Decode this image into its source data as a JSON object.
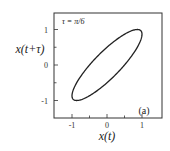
{
  "chart_data": {
    "type": "line",
    "title": "",
    "annotation": "τ = π/6",
    "panel_label": "(a)",
    "xlabel": "x(t)",
    "ylabel": "x(t+τ)",
    "xlim": [
      -1.35,
      1.35
    ],
    "ylim": [
      -1.45,
      1.45
    ],
    "xticks": [
      -1,
      0,
      1
    ],
    "yticks": [
      -1,
      0,
      1
    ],
    "xtick_labels": [
      "-1",
      "0",
      "1"
    ],
    "ytick_labels": [
      "-1",
      "0",
      "1"
    ],
    "minor_ticks_step": 0.5,
    "grid": false,
    "series": [
      {
        "name": "phase portrait x(t) = sin(t), x(t+τ) = sin(t+π/6)",
        "shape": "ellipse",
        "description": "Closed elliptical curve along the diagonal; x in [-1,1], y in [-1,1]",
        "x": [
          0.0,
          0.5,
          0.866,
          1.0,
          0.866,
          0.5,
          0.0,
          -0.5,
          -0.866,
          -1.0,
          -0.866,
          -0.5,
          0.0
        ],
        "y": [
          0.5,
          0.866,
          1.0,
          0.866,
          0.5,
          0.0,
          -0.5,
          -0.866,
          -1.0,
          -0.866,
          -0.5,
          0.0,
          0.5
        ]
      }
    ]
  }
}
